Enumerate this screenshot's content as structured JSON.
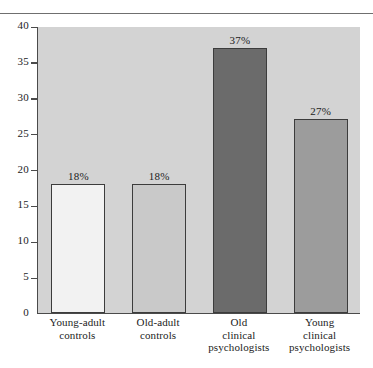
{
  "chart_data": {
    "type": "bar",
    "title": "",
    "xlabel": "",
    "ylabel": "",
    "ylim": [
      0,
      40
    ],
    "ytick_step": 5,
    "yticks": [
      0,
      5,
      10,
      15,
      20,
      25,
      30,
      35,
      40
    ],
    "ytick_labels": [
      "0",
      "5",
      "10",
      "15",
      "20",
      "25",
      "30",
      "35",
      "40"
    ],
    "grid": false,
    "legend": "none",
    "categories": [
      "Young-adult controls",
      "Old-adult controls",
      "Old clinical psychologists",
      "Young clinical psychologists"
    ],
    "category_lines": [
      [
        "Young-adult",
        "controls"
      ],
      [
        "Old-adult",
        "controls"
      ],
      [
        "Old",
        "clinical",
        "psychologists"
      ],
      [
        "Young",
        "clinical",
        "psychologists"
      ]
    ],
    "values": [
      18,
      18,
      37,
      27
    ],
    "data_labels": [
      "18%",
      "18%",
      "37%",
      "27%"
    ],
    "bar_colors": [
      "#f2f2f2",
      "#c9c9c9",
      "#6b6b6b",
      "#9c9c9c"
    ],
    "bar_border_color": "#3c3c3c",
    "plot_background": "#d3d3d3",
    "axis_color": "#4a4a4a",
    "text_color": "#1c1c1c"
  }
}
